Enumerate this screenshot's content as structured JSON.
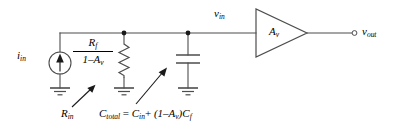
{
  "diagram": {
    "background_color": "#ffffff",
    "line_color": "#4d4d4d",
    "text_color": "#000000"
  },
  "labels": {
    "current_source": {
      "symbol": "i",
      "subscript": "in",
      "text": "i_in"
    },
    "input_node": {
      "symbol": "v",
      "subscript": "in",
      "text": "v_in"
    },
    "output_node": {
      "symbol": "v",
      "subscript": "out",
      "text": "v_out"
    },
    "amplifier_gain": {
      "symbol": "A",
      "subscript": "v",
      "text": "A_v"
    },
    "resistor_numerator": {
      "symbol": "R",
      "subscript": "f",
      "text": "R_f"
    },
    "resistor_denominator": {
      "text": "1-A_v",
      "lead": "1–A",
      "subscript": "v"
    },
    "resistor_callout": {
      "symbol": "R",
      "subscript": "in",
      "text": "R_in"
    },
    "capacitor_equation": {
      "lhs_symbol": "C",
      "lhs_subscript": "total",
      "equals": "=",
      "term1_symbol": "C",
      "term1_subscript": "in",
      "plus": "+",
      "factor_open": "(1–A",
      "factor_subscript": "v",
      "factor_close": ")",
      "term2_symbol": "C",
      "term2_subscript": "f",
      "text": "C_total = C_in + (1-A_v)C_f"
    }
  },
  "components": [
    {
      "name": "current-source",
      "type": "current-source",
      "label": "i_in",
      "arrow_direction": "up"
    },
    {
      "name": "resistor",
      "type": "resistor",
      "label": "R_f/(1-A_v)"
    },
    {
      "name": "capacitor",
      "type": "capacitor",
      "label": "C_total"
    },
    {
      "name": "amplifier",
      "type": "triangle-amplifier",
      "label": "A_v"
    },
    {
      "name": "ground-source",
      "type": "ground"
    },
    {
      "name": "ground-resistor",
      "type": "ground"
    },
    {
      "name": "ground-capacitor",
      "type": "ground"
    },
    {
      "name": "output-terminal",
      "type": "open-terminal",
      "label": "v_out"
    }
  ],
  "nodes": [
    {
      "name": "junction-resistor",
      "x": 124,
      "y": 33
    },
    {
      "name": "junction-capacitor",
      "x": 188,
      "y": 33
    }
  ],
  "annotations": [
    {
      "name": "callout-rin",
      "text": "R_in",
      "points_to": "resistor"
    },
    {
      "name": "callout-ctotal",
      "text": "C_total = C_in + (1-A_v)C_f",
      "points_to": "capacitor"
    }
  ]
}
